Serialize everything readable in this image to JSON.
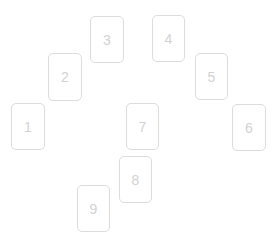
{
  "canvas": {
    "width": 275,
    "height": 248,
    "background_color": "#ffffff"
  },
  "style": {
    "card_background": "#ffffff",
    "card_border_color": "#dcdcdc",
    "card_label_color": "#d2d2d2",
    "card_corner_radius": 5
  },
  "cards": [
    {
      "label": "1",
      "x": 11,
      "y": 103,
      "w": 34,
      "h": 47
    },
    {
      "label": "2",
      "x": 48,
      "y": 53,
      "w": 34,
      "h": 48
    },
    {
      "label": "3",
      "x": 90,
      "y": 16,
      "w": 34,
      "h": 47
    },
    {
      "label": "4",
      "x": 152,
      "y": 15,
      "w": 33,
      "h": 47
    },
    {
      "label": "5",
      "x": 195,
      "y": 53,
      "w": 33,
      "h": 47
    },
    {
      "label": "6",
      "x": 232,
      "y": 104,
      "w": 34,
      "h": 47
    },
    {
      "label": "7",
      "x": 126,
      "y": 103,
      "w": 33,
      "h": 47
    },
    {
      "label": "8",
      "x": 119,
      "y": 156,
      "w": 33,
      "h": 47
    },
    {
      "label": "9",
      "x": 77,
      "y": 185,
      "w": 33,
      "h": 47
    }
  ]
}
